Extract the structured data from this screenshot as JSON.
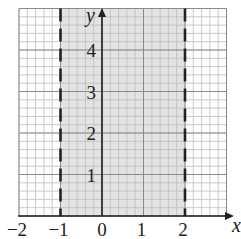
{
  "chart_data": {
    "type": "region",
    "xlabel": "x",
    "ylabel": "y",
    "xlim": [
      -2,
      3
    ],
    "ylim": [
      0,
      5
    ],
    "x_ticks": [
      "−2",
      "−1",
      "0",
      "1",
      "2"
    ],
    "y_ticks": [
      "1",
      "2",
      "3",
      "4"
    ],
    "grid": {
      "major_step": 1,
      "minor_per_unit": 5
    },
    "boundaries": [
      {
        "type": "vertical",
        "x": -1,
        "style": "dashed"
      },
      {
        "type": "vertical",
        "x": 2,
        "style": "dashed"
      }
    ],
    "shaded_region": {
      "x_min": -1,
      "x_max": 2,
      "inequality": "-1 < x < 2"
    },
    "colors": {
      "shade": "#e3e3e3",
      "minor_grid": "#bdbdbd",
      "major_grid": "#8a8a8a",
      "axis": "#222222",
      "dash": "#222222"
    }
  }
}
